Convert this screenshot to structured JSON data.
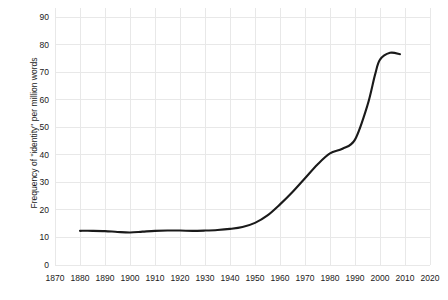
{
  "chart_data": {
    "type": "line",
    "title": "",
    "xlabel": "",
    "ylabel": "Frequency of \"identity\" per million words",
    "xlim": [
      1870,
      2020
    ],
    "ylim": [
      0,
      90
    ],
    "grid": true,
    "legend": false,
    "legend_position": "none",
    "line_color": "#1a1a1a",
    "grid_color": "#e8e8e8",
    "background_color": "#ffffff",
    "xticks": [
      1870,
      1880,
      1890,
      1900,
      1910,
      1920,
      1930,
      1940,
      1950,
      1960,
      1970,
      1980,
      1990,
      2000,
      2010,
      2020
    ],
    "yticks": [
      0,
      10,
      20,
      30,
      40,
      50,
      60,
      70,
      80,
      90
    ],
    "series": [
      {
        "name": "identity",
        "x": [
          1880,
          1885,
          1890,
          1895,
          1900,
          1905,
          1910,
          1915,
          1920,
          1925,
          1930,
          1935,
          1940,
          1945,
          1950,
          1955,
          1960,
          1965,
          1970,
          1975,
          1980,
          1985,
          1990,
          1995,
          1998,
          2000,
          2004,
          2008
        ],
        "values": [
          12.4,
          12.4,
          12.3,
          12.0,
          11.8,
          12.1,
          12.4,
          12.5,
          12.5,
          12.4,
          12.5,
          12.7,
          13.1,
          13.8,
          15.3,
          18.0,
          22.0,
          26.5,
          31.5,
          36.5,
          40.5,
          42.2,
          45.5,
          58.0,
          69.0,
          74.5,
          77.0,
          76.5
        ]
      }
    ]
  }
}
